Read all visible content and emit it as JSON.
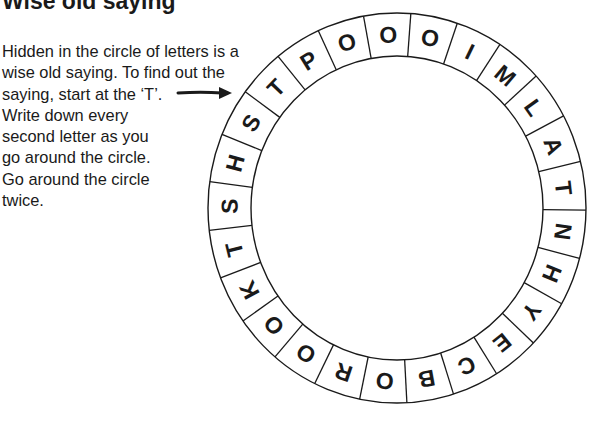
{
  "title": "Wise old saying",
  "instructions": {
    "lines": [
      "Hidden in the circle of letters is a",
      "wise old saying. To find out the",
      "saying, start at the ‘T’.",
      "Write down every",
      "second letter as you",
      "go around the circle.",
      "Go around the circle",
      "twice."
    ]
  },
  "pointer": {
    "icon": "arrow-right-icon",
    "target_letter": "T"
  },
  "circle": {
    "letter_count": 25,
    "letters_clockwise_from_start": [
      "T",
      "P",
      "O",
      "O",
      "O",
      "I",
      "M",
      "L",
      "A",
      "T",
      "N",
      "H",
      "Y",
      "E",
      "C",
      "B",
      "O",
      "R",
      "O",
      "O",
      "K",
      "T",
      "S",
      "H",
      "S"
    ],
    "start_index": 0,
    "colors": {
      "stroke": "#1a1a1a",
      "fill": "#ffffff",
      "text": "#1a1a1a"
    }
  }
}
